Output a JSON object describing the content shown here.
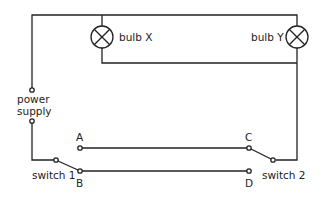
{
  "diagram": {
    "labels": {
      "bulb_x": "bulb X",
      "bulb_y": "bulb Y",
      "power": "power",
      "supply": "supply",
      "switch1": "switch 1",
      "switch2": "switch 2",
      "a": "A",
      "b": "B",
      "c": "C",
      "d": "D"
    },
    "colors": {
      "wire": "#222222",
      "background": "#ffffff"
    }
  }
}
